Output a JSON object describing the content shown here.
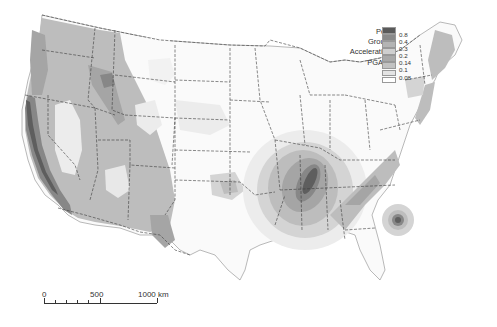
{
  "map": {
    "title": "Peak Ground Acceleration map of the conterminous United States",
    "region": "Conterminous United States"
  },
  "legend": {
    "title_lines": [
      "Peak",
      "Ground",
      "Acceleration,",
      "PGA [g]"
    ],
    "classes": [
      {
        "label": "0.8",
        "color": "#5a5a5a"
      },
      {
        "label": "0.4",
        "color": "#8a8a8a"
      },
      {
        "label": "0.3",
        "color": "#b4b4b4"
      },
      {
        "label": "0.2",
        "color": "#cfcfcf"
      },
      {
        "label": "0.14",
        "color": "#a9a9a9"
      },
      {
        "label": "0.1",
        "color": "#c2c2c2"
      },
      {
        "label": "0.08",
        "color": "#e4e4e4"
      },
      {
        "label": "",
        "color": "#ffffff"
      }
    ]
  },
  "scale_bar": {
    "labels": [
      "0",
      "500",
      "1000 km"
    ]
  },
  "colors": {
    "land_low": "#fafafa",
    "level_1": "#ececec",
    "level_2": "#d4d4d4",
    "level_3": "#bdbdbd",
    "level_4": "#a5a5a5",
    "level_5": "#878787",
    "level_6": "#5e5e5e",
    "border": "#3a3a3a"
  }
}
